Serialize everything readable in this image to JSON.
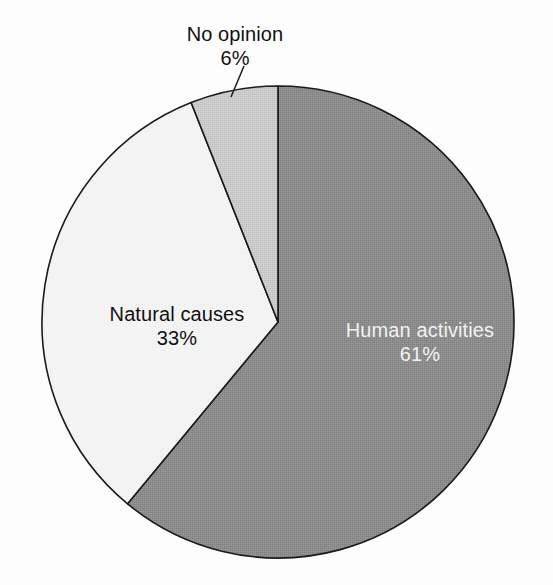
{
  "chart_data": {
    "type": "pie",
    "title": "",
    "subtitle": "",
    "xlabel": "",
    "ylabel": "",
    "legend_position": "none",
    "grid": false,
    "units": "percent",
    "start_angle_deg": 0,
    "direction": "clockwise",
    "categories": [
      "Human activities",
      "Natural causes",
      "No opinion"
    ],
    "values": [
      61,
      33,
      6
    ],
    "slices": [
      {
        "label": "Human activities",
        "value": 61,
        "value_text": "61%",
        "color": "#8a8a8a",
        "label_color": "#f2f2f2",
        "label_placement": "inside",
        "start_deg": 0,
        "end_deg": 219.6
      },
      {
        "label": "Natural causes",
        "value": 33,
        "value_text": "33%",
        "color": "#f2f2f2",
        "label_color": "#111111",
        "label_placement": "inside",
        "start_deg": 219.6,
        "end_deg": 338.4
      },
      {
        "label": "No opinion",
        "value": 6,
        "value_text": "6%",
        "color": "#c9c9c9",
        "label_color": "#101010",
        "label_placement": "outside-with-leader",
        "start_deg": 338.4,
        "end_deg": 360
      }
    ],
    "stroke_color": "#1a1a1a",
    "background": "#fdfdfd"
  },
  "labels": {
    "no_opinion": {
      "name": "No opinion",
      "pct": "6%"
    },
    "natural_causes": {
      "name": "Natural causes",
      "pct": "33%"
    },
    "human_activities": {
      "name": "Human activities",
      "pct": "61%"
    }
  }
}
